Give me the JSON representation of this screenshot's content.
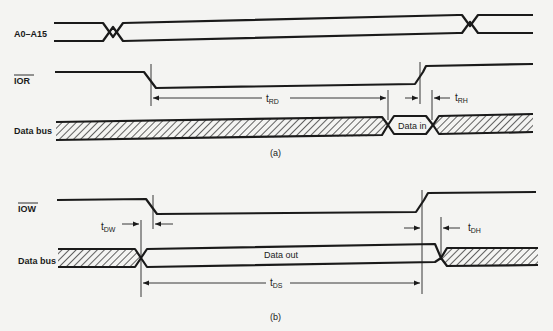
{
  "diagram": {
    "part_a": {
      "caption": "(a)",
      "signals": {
        "address": "A0–A15",
        "ior": "IOR",
        "data_bus": "Data bus"
      },
      "bus_window_label": "Data in",
      "timing": {
        "t_rd": {
          "main": "t",
          "sub": "RD"
        },
        "t_rh": {
          "main": "t",
          "sub": "RH"
        }
      }
    },
    "part_b": {
      "caption": "(b)",
      "signals": {
        "iow": "IOW",
        "data_bus": "Data bus"
      },
      "bus_window_label": "Data out",
      "timing": {
        "t_dw": {
          "main": "t",
          "sub": "DW"
        },
        "t_ds": {
          "main": "t",
          "sub": "DS"
        },
        "t_dh": {
          "main": "t",
          "sub": "DH"
        }
      }
    }
  }
}
